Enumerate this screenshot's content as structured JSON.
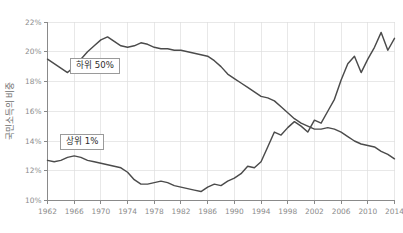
{
  "chart_data": {
    "type": "line",
    "title": "",
    "xlabel": "",
    "ylabel": "국민소득의 비중",
    "xlim": [
      1962,
      2014
    ],
    "ylim": [
      10,
      22
    ],
    "grid": true,
    "legend_position": "inline-boxes",
    "x": [
      1962,
      1963,
      1964,
      1965,
      1966,
      1967,
      1968,
      1969,
      1970,
      1971,
      1972,
      1973,
      1974,
      1975,
      1976,
      1977,
      1978,
      1979,
      1980,
      1981,
      1982,
      1983,
      1984,
      1985,
      1986,
      1987,
      1988,
      1989,
      1990,
      1991,
      1992,
      1993,
      1994,
      1995,
      1996,
      1997,
      1998,
      1999,
      2000,
      2001,
      2002,
      2003,
      2004,
      2005,
      2006,
      2007,
      2008,
      2009,
      2010,
      2011,
      2012,
      2013,
      2014
    ],
    "xticks": [
      1962,
      1966,
      1970,
      1974,
      1978,
      1982,
      1986,
      1990,
      1994,
      1998,
      2002,
      2006,
      2010,
      2014
    ],
    "xtick_labels": [
      "1962",
      "1966",
      "1970",
      "1974",
      "1978",
      "1982",
      "1986",
      "1990",
      "1994",
      "1998",
      "2002",
      "2006",
      "2010",
      "2014"
    ],
    "yticks": [
      10,
      12,
      14,
      16,
      18,
      20,
      22
    ],
    "ytick_labels": [
      "10%",
      "12%",
      "14%",
      "16%",
      "18%",
      "20%",
      "22%"
    ],
    "series": [
      {
        "name": "하위 50%",
        "label": "하위 50%",
        "color": "#4b4b4b",
        "values": [
          19.5,
          19.2,
          18.9,
          18.6,
          19.0,
          19.5,
          20.0,
          20.4,
          20.8,
          21.0,
          20.7,
          20.4,
          20.3,
          20.4,
          20.6,
          20.5,
          20.3,
          20.2,
          20.2,
          20.1,
          20.1,
          20.0,
          19.9,
          19.8,
          19.7,
          19.4,
          19.0,
          18.5,
          18.2,
          17.9,
          17.6,
          17.3,
          17.0,
          16.9,
          16.7,
          16.3,
          15.9,
          15.5,
          15.2,
          15.0,
          14.8,
          14.8,
          14.9,
          14.8,
          14.6,
          14.3,
          14.0,
          13.8,
          13.7,
          13.6,
          13.3,
          13.1,
          12.8
        ]
      },
      {
        "name": "상위 1%",
        "label": "상위 1%",
        "color": "#4b4b4b",
        "values": [
          12.7,
          12.6,
          12.7,
          12.9,
          13.0,
          12.9,
          12.7,
          12.6,
          12.5,
          12.4,
          12.3,
          12.2,
          11.9,
          11.4,
          11.1,
          11.1,
          11.2,
          11.3,
          11.2,
          11.0,
          10.9,
          10.8,
          10.7,
          10.6,
          10.9,
          11.1,
          11.0,
          11.3,
          11.5,
          11.8,
          12.3,
          12.2,
          12.6,
          13.6,
          14.6,
          14.4,
          14.9,
          15.3,
          15.0,
          14.6,
          15.4,
          15.2,
          16.0,
          16.8,
          18.1,
          19.2,
          19.7,
          18.6,
          19.5,
          20.3,
          21.3,
          20.1,
          20.9
        ]
      }
    ]
  }
}
